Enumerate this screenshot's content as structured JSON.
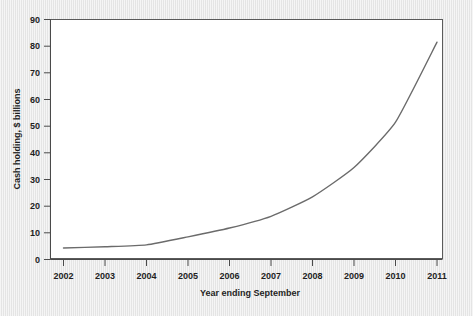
{
  "chart_data": {
    "type": "line",
    "title": "",
    "subtitle": "",
    "xlabel": "Year ending September",
    "ylabel": "Cash holding, $ billions",
    "x": [
      2002,
      2003,
      2004,
      2005,
      2006,
      2007,
      2008,
      2009,
      2010,
      2011
    ],
    "categories": [
      "2002",
      "2003",
      "2004",
      "2005",
      "2006",
      "2007",
      "2008",
      "2009",
      "2010",
      "2011"
    ],
    "values": [
      4.3,
      4.8,
      5.5,
      8.5,
      11.8,
      16.2,
      23.5,
      34.5,
      51.5,
      81.5
    ],
    "series": [
      {
        "name": "Cash holding",
        "values": [
          4.3,
          4.8,
          5.5,
          8.5,
          11.8,
          16.2,
          23.5,
          34.5,
          51.5,
          81.5
        ],
        "color": "#6b6b6b"
      }
    ],
    "xlim": [
      2002,
      2011
    ],
    "ylim": [
      0,
      90
    ],
    "yticks": [
      0,
      10,
      20,
      30,
      40,
      50,
      60,
      70,
      80,
      90
    ],
    "ytick_labels": [
      "0",
      "10",
      "20",
      "30",
      "40",
      "50",
      "60",
      "70",
      "80",
      "90"
    ],
    "xticks": [
      2002,
      2003,
      2004,
      2005,
      2006,
      2007,
      2008,
      2009,
      2010,
      2011
    ],
    "xtick_labels": [
      "2002",
      "2003",
      "2004",
      "2005",
      "2006",
      "2007",
      "2008",
      "2009",
      "2010",
      "2011"
    ],
    "grid": false,
    "legend": false,
    "legend_position": "none",
    "annotations": []
  },
  "colors": {
    "page_background": "#e9e9e9",
    "plot_background": "#ffffff",
    "line": "#6b6b6b",
    "axis": "#4a4a4a",
    "frame": "#5a5a5a",
    "text": "#1f1f1f"
  }
}
